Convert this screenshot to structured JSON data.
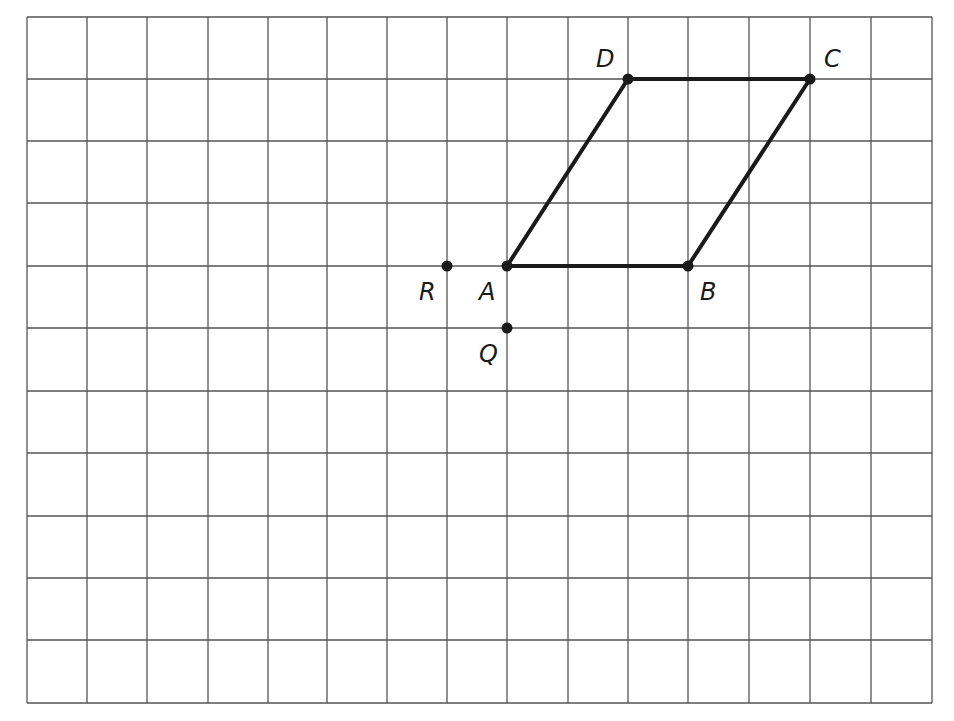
{
  "diagram": {
    "type": "grid-geometry",
    "grid": {
      "columns": 15,
      "rows": 11,
      "x_lines": [
        27,
        87,
        147,
        208,
        268,
        327,
        387,
        447,
        507,
        568,
        628,
        688,
        749,
        810,
        871,
        932
      ],
      "y_lines": [
        17,
        79,
        141,
        203,
        266,
        328,
        391,
        453,
        516,
        578,
        640,
        703
      ],
      "line_color": "#555555"
    },
    "points": [
      {
        "name": "A",
        "label": "A",
        "col": 8,
        "row": 4,
        "label_dx": -28,
        "label_dy": 34
      },
      {
        "name": "B",
        "label": "B",
        "col": 11,
        "row": 4,
        "label_dx": 12,
        "label_dy": 34
      },
      {
        "name": "C",
        "label": "C",
        "col": 13,
        "row": 1,
        "label_dx": 14,
        "label_dy": -12
      },
      {
        "name": "D",
        "label": "D",
        "col": 10,
        "row": 1,
        "label_dx": -32,
        "label_dy": -12
      },
      {
        "name": "R",
        "label": "R",
        "col": 7,
        "row": 4,
        "label_dx": -28,
        "label_dy": 34
      },
      {
        "name": "Q",
        "label": "Q",
        "col": 8,
        "row": 5,
        "label_dx": -28,
        "label_dy": 34
      }
    ],
    "polygon": {
      "name": "parallelogram ABCD",
      "vertices": [
        "A",
        "B",
        "C",
        "D"
      ],
      "stroke": "#1a1a1a",
      "stroke_width": 4
    },
    "point_color": "#1a1a1a"
  }
}
